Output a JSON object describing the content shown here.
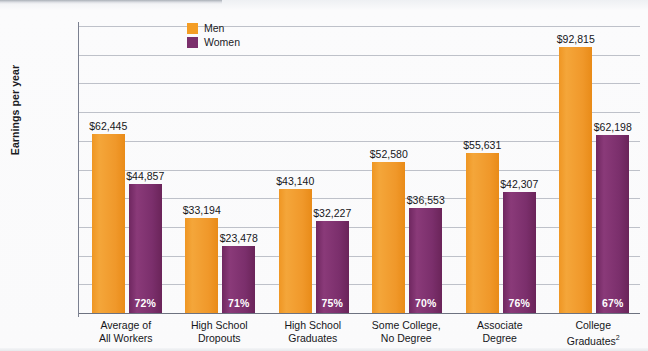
{
  "chart_data": {
    "type": "bar",
    "title": "",
    "subtitle": "",
    "xlabel": "",
    "ylabel": "Earnings per year",
    "ylim": [
      0,
      100000
    ],
    "ytick_step": 10000,
    "ytick_labels": [
      "$100,000",
      "$90,000",
      "$80,000",
      "$70,000",
      "$60,000",
      "$50,000",
      "$40,000",
      "$30,000",
      "$20,000",
      "$10,000",
      "0"
    ],
    "ytick_values": [
      100000,
      90000,
      80000,
      70000,
      60000,
      50000,
      40000,
      30000,
      20000,
      10000,
      0
    ],
    "grid": true,
    "legend_position": "top-left-inside",
    "categories": [
      "Average of\nAll Workers",
      "High School\nDropouts",
      "High School\nGraduates",
      "Some College,\nNo Degree",
      "Associate\nDegree",
      "College\nGraduates2"
    ],
    "category_lines": [
      [
        "Average of",
        "All Workers"
      ],
      [
        "High School",
        "Dropouts"
      ],
      [
        "High School",
        "Graduates"
      ],
      [
        "Some College,",
        "No Degree"
      ],
      [
        "Associate",
        "Degree"
      ],
      [
        "College",
        "Graduates"
      ]
    ],
    "category_superscripts": [
      "",
      "",
      "",
      "",
      "",
      "2"
    ],
    "series": [
      {
        "name": "Men",
        "color": "#f49d24",
        "values": [
          62445,
          33194,
          43140,
          52580,
          55631,
          92815
        ],
        "labels": [
          "$62,445",
          "$33,194",
          "$43,140",
          "$52,580",
          "$55,631",
          "$92,815"
        ]
      },
      {
        "name": "Women",
        "color": "#7b2f6c",
        "values": [
          44857,
          23478,
          32227,
          36553,
          42307,
          62198
        ],
        "labels": [
          "$44,857",
          "$23,478",
          "$32,227",
          "$36,553",
          "$42,307",
          "$62,198"
        ],
        "inbar_labels": [
          "72%",
          "71%",
          "75%",
          "70%",
          "76%",
          "67%"
        ]
      }
    ]
  },
  "colors": {
    "men": "#f49d24",
    "women": "#7b2f6c",
    "grid": "#a9aeb8",
    "axis": "#7b8090",
    "text": "#16161a",
    "background": "#fafafb"
  }
}
